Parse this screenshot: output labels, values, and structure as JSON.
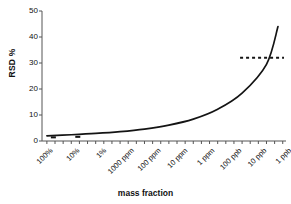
{
  "chart_data": {
    "type": "line",
    "title": "",
    "subtitle": "",
    "xlabel": "mass fraction",
    "ylabel": "RSD %",
    "ylim": [
      0,
      50
    ],
    "yticks": [
      0,
      10,
      20,
      30,
      40,
      50
    ],
    "ytick_labels": [
      "0",
      "10",
      "20",
      "30",
      "40",
      "50"
    ],
    "xtick_labels": [
      "100%",
      "10%",
      "1%",
      "1000 ppm",
      "100 ppm",
      "10 ppm",
      "1 ppm",
      "100 ppb",
      "10 ppb",
      "1 ppb"
    ],
    "xtick_rotation_deg": 45,
    "x_is_log_decades": true,
    "minor_ticks_per_decade": 3,
    "grid": false,
    "legend": "none",
    "series": [
      {
        "name": "Horwitz RSD curve",
        "style": "solid",
        "color": "#000000",
        "x": [
          "100%",
          "10%",
          "1%",
          "1000 ppm",
          "100 ppm",
          "10 ppm",
          "1 ppm",
          "100 ppb",
          "10 ppb",
          "1 ppb",
          "end"
        ],
        "values": [
          2.0,
          2.4,
          2.9,
          3.6,
          4.6,
          6.1,
          8.4,
          12.2,
          18.4,
          29.5,
          44.0
        ]
      },
      {
        "name": "RSD ceiling",
        "style": "dashed",
        "color": "#000000",
        "constant_value": 32,
        "x_start": "10 ppb",
        "x_end": "1 ppb",
        "values": [
          32,
          32
        ]
      },
      {
        "name": "low-level markers",
        "style": "markers",
        "color": "#000000",
        "x": [
          "100%",
          "10%"
        ],
        "values": [
          1.4,
          1.6
        ]
      }
    ],
    "annotations": [
      {
        "text": "dashed horizontal line at RSD 32%",
        "y": 32
      }
    ]
  },
  "axis": {
    "y_axis_name": "RSD %",
    "x_axis_name": "mass fraction"
  }
}
